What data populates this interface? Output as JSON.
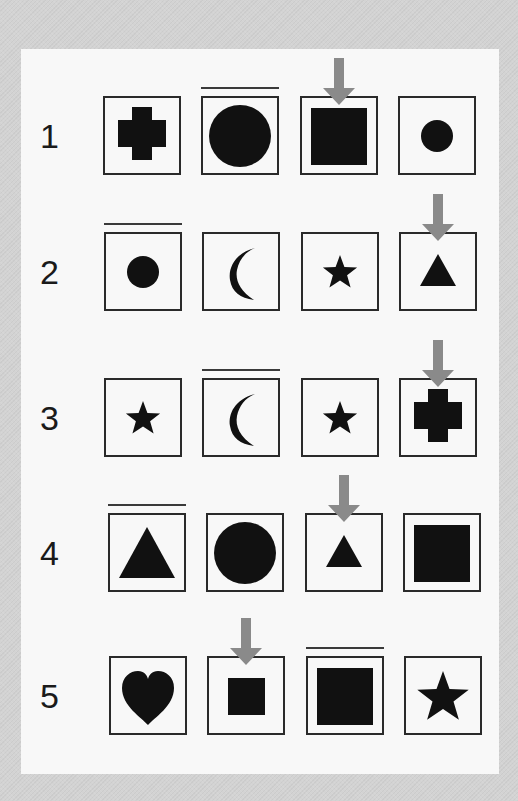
{
  "colors": {
    "outer_background": "#d3d3d3",
    "panel_background": "#f8f8f8",
    "shape_fill": "#111111",
    "box_border": "#2a2a2a",
    "arrow": "#8a8a8a",
    "overline": "#3a3a3a"
  },
  "rows": [
    {
      "number": "1",
      "cells": [
        {
          "shape": "cross",
          "size": "large",
          "overline": false,
          "arrow": false
        },
        {
          "shape": "circle",
          "size": "large",
          "overline": true,
          "arrow": false
        },
        {
          "shape": "square",
          "size": "large",
          "overline": false,
          "arrow": true
        },
        {
          "shape": "circle",
          "size": "small",
          "overline": false,
          "arrow": false
        }
      ]
    },
    {
      "number": "2",
      "cells": [
        {
          "shape": "circle",
          "size": "small",
          "overline": true,
          "arrow": false
        },
        {
          "shape": "crescent",
          "size": "large",
          "overline": false,
          "arrow": false
        },
        {
          "shape": "star",
          "size": "small",
          "overline": false,
          "arrow": false
        },
        {
          "shape": "triangle",
          "size": "small",
          "overline": false,
          "arrow": true
        }
      ]
    },
    {
      "number": "3",
      "cells": [
        {
          "shape": "star",
          "size": "small",
          "overline": false,
          "arrow": false
        },
        {
          "shape": "crescent",
          "size": "large",
          "overline": true,
          "arrow": false
        },
        {
          "shape": "star",
          "size": "small",
          "overline": false,
          "arrow": false
        },
        {
          "shape": "cross",
          "size": "large",
          "overline": false,
          "arrow": true
        }
      ]
    },
    {
      "number": "4",
      "cells": [
        {
          "shape": "triangle",
          "size": "large",
          "overline": true,
          "arrow": false
        },
        {
          "shape": "circle",
          "size": "large",
          "overline": false,
          "arrow": false
        },
        {
          "shape": "triangle",
          "size": "small",
          "overline": false,
          "arrow": true
        },
        {
          "shape": "square",
          "size": "large",
          "overline": false,
          "arrow": false
        }
      ]
    },
    {
      "number": "5",
      "cells": [
        {
          "shape": "heart",
          "size": "large",
          "overline": false,
          "arrow": false
        },
        {
          "shape": "square",
          "size": "small",
          "overline": false,
          "arrow": true
        },
        {
          "shape": "square",
          "size": "large",
          "overline": true,
          "arrow": false
        },
        {
          "shape": "star",
          "size": "large",
          "overline": false,
          "arrow": false
        }
      ]
    }
  ]
}
